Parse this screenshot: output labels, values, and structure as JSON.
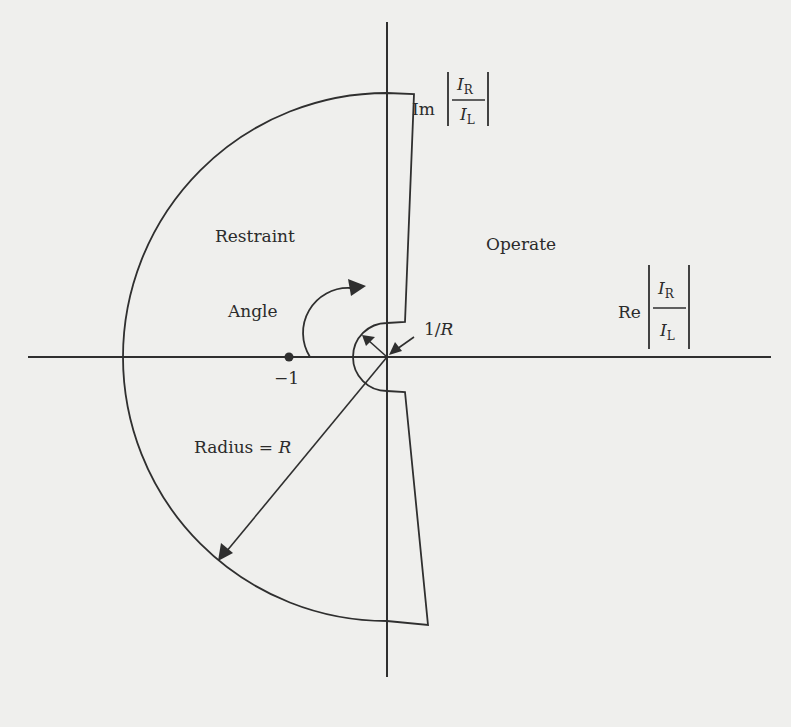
{
  "diagram": {
    "title": "",
    "colors": {
      "background": "#efefed",
      "ink": "#2f2f2f"
    },
    "axes": {
      "im_axis_label": {
        "prefix": "Im",
        "numerator": "I",
        "numerator_sub": "R",
        "denominator": "I",
        "denominator_sub": "L"
      },
      "re_axis_label": {
        "prefix": "Re",
        "numerator": "I",
        "numerator_sub": "R",
        "denominator": "I",
        "denominator_sub": "L"
      }
    },
    "regions": {
      "restraint": "Restraint",
      "operate": "Operate"
    },
    "annotations": {
      "angle": "Angle",
      "minus_one": "−1",
      "inner_radius": "1/",
      "inner_radius_var": "R",
      "outer_radius": "Radius = ",
      "outer_radius_var": "R"
    },
    "geometry": {
      "origin": [
        387,
        357
      ],
      "outer_radius_px": 264,
      "inner_radius_px": 34,
      "point_minus_one": [
        289,
        357
      ]
    }
  }
}
